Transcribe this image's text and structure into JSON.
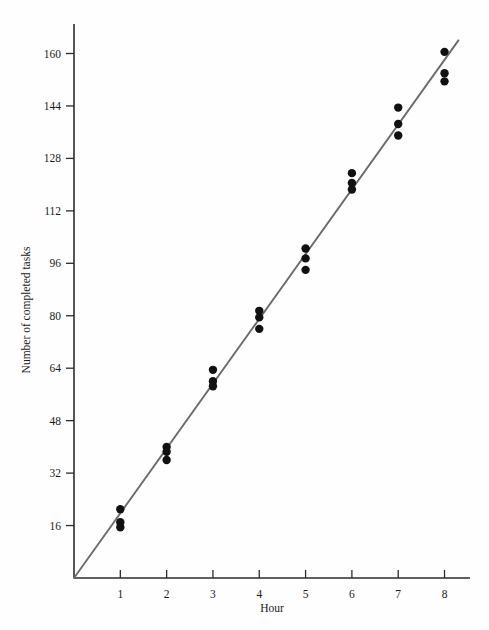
{
  "chart_data": {
    "type": "scatter",
    "title": "",
    "xlabel": "Hour",
    "ylabel": "Number of completed tasks",
    "xlim": [
      0,
      8.55
    ],
    "ylim": [
      0,
      169
    ],
    "grid": false,
    "legend": null,
    "xticks": [
      1,
      2,
      3,
      4,
      5,
      6,
      7,
      8
    ],
    "xtick_labels": [
      "1",
      "2",
      "3",
      "4",
      "5",
      "6",
      "7",
      "8"
    ],
    "yticks": [
      16,
      32,
      48,
      64,
      80,
      96,
      112,
      128,
      144,
      160
    ],
    "ytick_labels": [
      "16",
      "32",
      "48",
      "64",
      "80",
      "96",
      "112",
      "128",
      "144",
      "160"
    ],
    "series": [
      {
        "name": "completed tasks",
        "type": "scatter",
        "marker": "filled-circle",
        "color": "#111111",
        "points": [
          {
            "x": 1,
            "y": 21
          },
          {
            "x": 1,
            "y": 17
          },
          {
            "x": 1,
            "y": 15.5
          },
          {
            "x": 2,
            "y": 40
          },
          {
            "x": 2,
            "y": 38.5
          },
          {
            "x": 2,
            "y": 36
          },
          {
            "x": 3,
            "y": 63.5
          },
          {
            "x": 3,
            "y": 60
          },
          {
            "x": 3,
            "y": 58.5
          },
          {
            "x": 4,
            "y": 81.5
          },
          {
            "x": 4,
            "y": 79.5
          },
          {
            "x": 4,
            "y": 76
          },
          {
            "x": 5,
            "y": 100.5
          },
          {
            "x": 5,
            "y": 97.5
          },
          {
            "x": 5,
            "y": 94
          },
          {
            "x": 6,
            "y": 123.5
          },
          {
            "x": 6,
            "y": 120.5
          },
          {
            "x": 6,
            "y": 118.5
          },
          {
            "x": 7,
            "y": 143.5
          },
          {
            "x": 7,
            "y": 138.5
          },
          {
            "x": 7,
            "y": 135
          },
          {
            "x": 8,
            "y": 160.5
          },
          {
            "x": 8,
            "y": 154
          },
          {
            "x": 8,
            "y": 151.5
          }
        ]
      },
      {
        "name": "regression line",
        "type": "line",
        "color": "#6b6b6b",
        "x0": 0,
        "y0": 0,
        "x1": 8.3,
        "y1": 164
      }
    ]
  },
  "axes": {
    "x_axis_name": "Hour",
    "y_axis_name": "Number of completed tasks"
  }
}
